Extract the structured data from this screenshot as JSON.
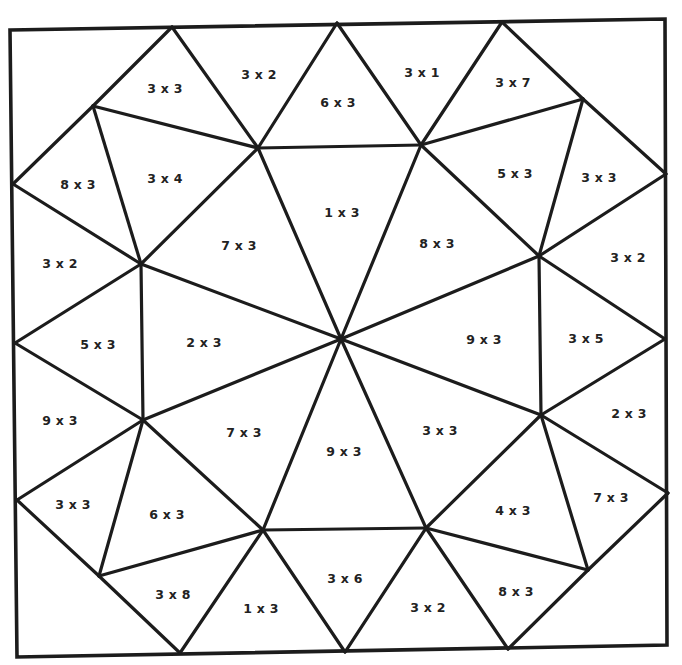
{
  "worksheet": {
    "type": "multiplication color-by-number mosaic",
    "frame": [
      [
        10,
        30
      ],
      [
        665,
        19
      ],
      [
        667,
        645
      ],
      [
        17,
        657
      ]
    ],
    "ink_color": "#1c1c1c",
    "text_color": "#222222",
    "background": "#ffffff"
  },
  "vertices": {
    "TL": [
      10,
      30
    ],
    "TR": [
      665,
      19
    ],
    "BR": [
      667,
      645
    ],
    "BL": [
      17,
      657
    ],
    "T1": [
      172,
      27
    ],
    "T2": [
      337,
      23
    ],
    "T3": [
      502,
      22
    ],
    "L1": [
      13,
      184
    ],
    "L2": [
      15,
      343
    ],
    "L3": [
      17,
      500
    ],
    "R1": [
      666,
      174
    ],
    "R2": [
      665,
      339
    ],
    "R3": [
      668,
      493
    ],
    "B1": [
      180,
      653
    ],
    "B2": [
      345,
      652
    ],
    "B3": [
      508,
      649
    ],
    "A": [
      93,
      106
    ],
    "B": [
      258,
      148
    ],
    "C": [
      421,
      145
    ],
    "D": [
      583,
      99
    ],
    "E": [
      141,
      264
    ],
    "F": [
      539,
      256
    ],
    "G": [
      143,
      420
    ],
    "H": [
      541,
      415
    ],
    "I": [
      99,
      576
    ],
    "J": [
      263,
      530
    ],
    "K": [
      426,
      528
    ],
    "M": [
      588,
      570
    ],
    "O": [
      341,
      339
    ]
  },
  "edges": [
    [
      "T1",
      "A"
    ],
    [
      "A",
      "L1"
    ],
    [
      "T1",
      "B"
    ],
    [
      "B",
      "T2"
    ],
    [
      "T2",
      "C"
    ],
    [
      "C",
      "T3"
    ],
    [
      "T3",
      "D"
    ],
    [
      "D",
      "R1"
    ],
    [
      "B",
      "C"
    ],
    [
      "A",
      "B"
    ],
    [
      "C",
      "D"
    ],
    [
      "A",
      "E"
    ],
    [
      "B",
      "E"
    ],
    [
      "L1",
      "E"
    ],
    [
      "C",
      "F"
    ],
    [
      "D",
      "F"
    ],
    [
      "R1",
      "F"
    ],
    [
      "B",
      "O"
    ],
    [
      "C",
      "O"
    ],
    [
      "E",
      "O"
    ],
    [
      "F",
      "O"
    ],
    [
      "L2",
      "E"
    ],
    [
      "L2",
      "G"
    ],
    [
      "E",
      "G"
    ],
    [
      "R2",
      "F"
    ],
    [
      "R2",
      "H"
    ],
    [
      "F",
      "H"
    ],
    [
      "G",
      "O"
    ],
    [
      "H",
      "O"
    ],
    [
      "J",
      "O"
    ],
    [
      "K",
      "O"
    ],
    [
      "J",
      "K"
    ],
    [
      "L3",
      "G"
    ],
    [
      "L3",
      "I"
    ],
    [
      "G",
      "I"
    ],
    [
      "G",
      "J"
    ],
    [
      "I",
      "J"
    ],
    [
      "I",
      "B1"
    ],
    [
      "J",
      "B1"
    ],
    [
      "J",
      "B2"
    ],
    [
      "H",
      "R3"
    ],
    [
      "R3",
      "M"
    ],
    [
      "H",
      "M"
    ],
    [
      "H",
      "K"
    ],
    [
      "K",
      "M"
    ],
    [
      "M",
      "B3"
    ],
    [
      "K",
      "B3"
    ],
    [
      "K",
      "B2"
    ]
  ],
  "labels": [
    {
      "text": "3 x 3",
      "x": 165,
      "y": 88
    },
    {
      "text": "3 x 2",
      "x": 259,
      "y": 74
    },
    {
      "text": "6 x 3",
      "x": 338,
      "y": 102
    },
    {
      "text": "3 x 1",
      "x": 422,
      "y": 72
    },
    {
      "text": "3 x 7",
      "x": 513,
      "y": 82
    },
    {
      "text": "8 x 3",
      "x": 78,
      "y": 184
    },
    {
      "text": "3 x 4",
      "x": 165,
      "y": 178
    },
    {
      "text": "1 x 3",
      "x": 342,
      "y": 212
    },
    {
      "text": "5 x 3",
      "x": 515,
      "y": 173
    },
    {
      "text": "3 x 3",
      "x": 599,
      "y": 177
    },
    {
      "text": "7 x 3",
      "x": 239,
      "y": 245
    },
    {
      "text": "8 x 3",
      "x": 437,
      "y": 243
    },
    {
      "text": "3 x 2",
      "x": 60,
      "y": 263
    },
    {
      "text": "3 x 2",
      "x": 628,
      "y": 257
    },
    {
      "text": "5 x 3",
      "x": 98,
      "y": 344
    },
    {
      "text": "2 x 3",
      "x": 204,
      "y": 342
    },
    {
      "text": "9 x 3",
      "x": 484,
      "y": 339
    },
    {
      "text": "3 x 5",
      "x": 586,
      "y": 338
    },
    {
      "text": "9 x 3",
      "x": 60,
      "y": 420
    },
    {
      "text": "2 x 3",
      "x": 629,
      "y": 413
    },
    {
      "text": "7 x 3",
      "x": 244,
      "y": 432
    },
    {
      "text": "9 x 3",
      "x": 344,
      "y": 451
    },
    {
      "text": "3 x 3",
      "x": 440,
      "y": 430
    },
    {
      "text": "3 x 3",
      "x": 73,
      "y": 504
    },
    {
      "text": "6 x 3",
      "x": 167,
      "y": 514
    },
    {
      "text": "4 x 3",
      "x": 513,
      "y": 510
    },
    {
      "text": "7 x 3",
      "x": 611,
      "y": 497
    },
    {
      "text": "3 x 8",
      "x": 173,
      "y": 594
    },
    {
      "text": "1 x 3",
      "x": 261,
      "y": 608
    },
    {
      "text": "3 x 6",
      "x": 345,
      "y": 578
    },
    {
      "text": "3 x 2",
      "x": 428,
      "y": 607
    },
    {
      "text": "8 x 3",
      "x": 516,
      "y": 591
    }
  ]
}
